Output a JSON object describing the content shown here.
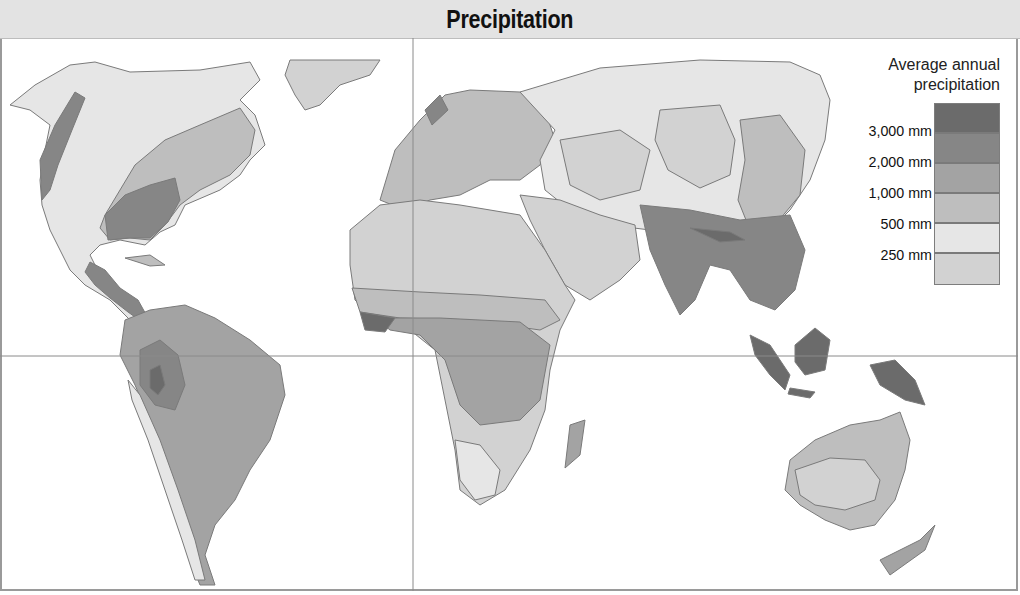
{
  "title": "Precipitation",
  "legend": {
    "title_line1": "Average annual",
    "title_line2": "precipitation",
    "classes": [
      {
        "range": "> 3,000 mm",
        "color": "#6b6b6b"
      },
      {
        "range": "2,000 – 3,000 mm",
        "color": "#868686"
      },
      {
        "range": "1,000 – 2,000 mm",
        "color": "#a3a3a3"
      },
      {
        "range": "500 – 1,000 mm",
        "color": "#bebebe"
      },
      {
        "range": "250 – 500 mm",
        "color": "#e6e6e6"
      },
      {
        "range": "< 250 mm",
        "color": "#d2d2d2"
      }
    ],
    "thresholds": [
      "3,000 mm",
      "2,000 mm",
      "1,000 mm",
      "500 mm",
      "250 mm"
    ]
  },
  "map": {
    "projection": "world",
    "gridlines": [
      "equator",
      "prime meridian"
    ],
    "regions": [
      {
        "name": "North America",
        "dominant": "250 – 1,000 mm"
      },
      {
        "name": "Eastern United States",
        "dominant": "1,000 – 2,000 mm"
      },
      {
        "name": "Central America",
        "dominant": "2,000 – 3,000 mm"
      },
      {
        "name": "South America (Amazon)",
        "dominant": "1,000 – 3,000 mm"
      },
      {
        "name": "Europe",
        "dominant": "500 – 1,000 mm"
      },
      {
        "name": "Northern Africa / Sahara",
        "dominant": "< 250 mm"
      },
      {
        "name": "Central Africa",
        "dominant": "1,000 – 2,000 mm"
      },
      {
        "name": "Central Asia",
        "dominant": "< 500 mm"
      },
      {
        "name": "South & Southeast Asia",
        "dominant": "1,000 – 3,000 mm"
      },
      {
        "name": "Indonesia / New Guinea",
        "dominant": "> 3,000 mm"
      },
      {
        "name": "Australia (interior)",
        "dominant": "< 500 mm"
      }
    ]
  }
}
